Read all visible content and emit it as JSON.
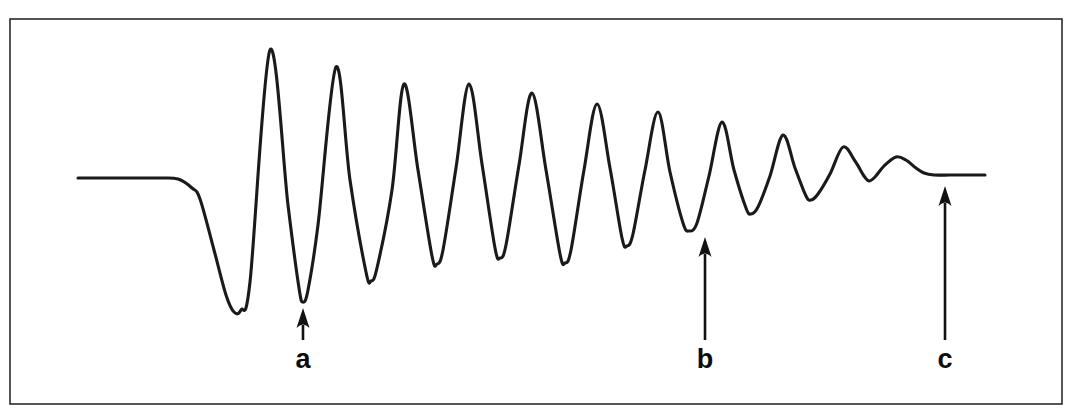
{
  "figure": {
    "kind": "damped-oscillation-trace",
    "background_color": "#ffffff",
    "frame": {
      "x": 10,
      "y": 19,
      "width": 1052,
      "height": 385,
      "stroke_color": "#2b2b2b",
      "stroke_width": 1.6
    },
    "trace": {
      "stroke_color": "#1a1a1a",
      "stroke_width": 3.1,
      "baseline_y": 178,
      "settled_y": 175,
      "start_x": 78,
      "end_x": 985
    }
  },
  "annotations": [
    {
      "label": "a",
      "name": "annotation-a",
      "target_x": 303,
      "target_y": 302,
      "tail_y": 340,
      "label_x": 303,
      "label_y": 368,
      "description": "arrow pointing up to an early deep trough"
    },
    {
      "label": "b",
      "name": "annotation-b",
      "target_x": 705,
      "target_y": 231,
      "tail_y": 340,
      "label_x": 705,
      "label_y": 368,
      "description": "arrow pointing up to a later shallower trough"
    },
    {
      "label": "c",
      "name": "annotation-c",
      "target_x": 945,
      "target_y": 180,
      "tail_y": 340,
      "label_x": 945,
      "label_y": 368,
      "description": "arrow pointing up to the final flat settled baseline"
    }
  ],
  "chart_data": {
    "type": "line",
    "title": "",
    "subtitle": "",
    "xlabel": "",
    "ylabel": "",
    "grid": false,
    "legend": null,
    "axis_visible": false,
    "xlim": [
      78,
      985
    ],
    "ylim": [
      404,
      19
    ],
    "note": "Pixel-space coordinates: x increases rightwards, y increases downwards. Baseline (zero amplitude) is y = 178 at the start and y = 175 after settling.",
    "series": [
      {
        "name": "damped-oscillation",
        "color": "#1a1a1a",
        "points": [
          [
            78,
            178
          ],
          [
            130,
            178
          ],
          [
            160,
            178
          ],
          [
            178,
            179
          ],
          [
            192,
            188
          ],
          [
            200,
            199
          ],
          [
            214,
            250
          ],
          [
            226,
            295
          ],
          [
            234,
            312
          ],
          [
            241,
            310
          ],
          [
            250,
            282
          ],
          [
            270,
            50
          ],
          [
            288,
            205
          ],
          [
            299,
            288
          ],
          [
            303,
            302
          ],
          [
            308,
            290
          ],
          [
            318,
            225
          ],
          [
            336,
            67
          ],
          [
            350,
            180
          ],
          [
            366,
            272
          ],
          [
            371,
            281
          ],
          [
            377,
            268
          ],
          [
            392,
            190
          ],
          [
            404,
            84
          ],
          [
            418,
            170
          ],
          [
            432,
            256
          ],
          [
            437,
            264
          ],
          [
            443,
            250
          ],
          [
            456,
            168
          ],
          [
            469,
            84
          ],
          [
            482,
            164
          ],
          [
            495,
            248
          ],
          [
            500,
            258
          ],
          [
            506,
            245
          ],
          [
            519,
            165
          ],
          [
            532,
            93
          ],
          [
            546,
            170
          ],
          [
            560,
            254
          ],
          [
            565,
            263
          ],
          [
            571,
            250
          ],
          [
            584,
            170
          ],
          [
            597,
            104
          ],
          [
            610,
            168
          ],
          [
            622,
            238
          ],
          [
            627,
            246
          ],
          [
            633,
            234
          ],
          [
            645,
            170
          ],
          [
            658,
            112
          ],
          [
            670,
            172
          ],
          [
            683,
            223
          ],
          [
            689,
            231
          ],
          [
            697,
            223
          ],
          [
            709,
            176
          ],
          [
            722,
            122
          ],
          [
            734,
            170
          ],
          [
            746,
            208
          ],
          [
            751,
            214
          ],
          [
            758,
            207
          ],
          [
            770,
            176
          ],
          [
            783,
            135
          ],
          [
            795,
            168
          ],
          [
            806,
            196
          ],
          [
            811,
            200
          ],
          [
            818,
            194
          ],
          [
            830,
            174
          ],
          [
            843,
            147
          ],
          [
            855,
            161
          ],
          [
            864,
            176
          ],
          [
            869,
            181
          ],
          [
            875,
            177
          ],
          [
            884,
            166
          ],
          [
            896,
            157
          ],
          [
            906,
            160
          ],
          [
            916,
            168
          ],
          [
            924,
            173
          ],
          [
            934,
            175
          ],
          [
            950,
            175
          ],
          [
            968,
            175
          ],
          [
            985,
            175
          ]
        ]
      }
    ],
    "features": {
      "initial_flat_baseline": {
        "x_range": [
          78,
          180
        ],
        "y": 178
      },
      "first_deflection_trough": {
        "x": 234,
        "y": 312,
        "note": "largest downward excursion"
      },
      "largest_peak": {
        "x": 270,
        "y": 50,
        "note": "largest upward excursion"
      },
      "peak_sequence_y": [
        50,
        67,
        84,
        84,
        93,
        104,
        112,
        122,
        135,
        147,
        156
      ],
      "trough_sequence_y": [
        312,
        302,
        281,
        264,
        258,
        263,
        246,
        231,
        214,
        200,
        181
      ],
      "final_flat_baseline": {
        "x_range": [
          900,
          985
        ],
        "y": 175
      },
      "oscillation_count": 11,
      "envelope": "exponentially decaying amplitude"
    }
  }
}
